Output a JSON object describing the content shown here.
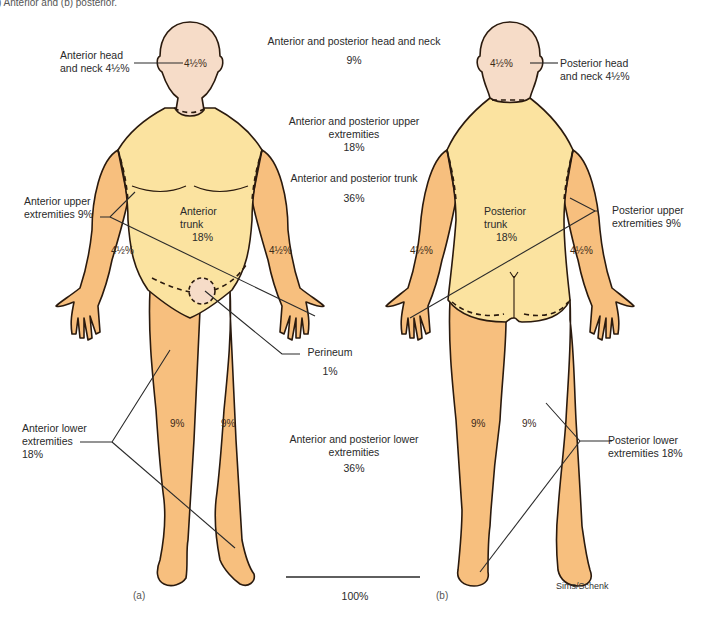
{
  "caption_fragment": ") Anterior and (b) posterior.",
  "colors": {
    "head": "#f6dcc8",
    "trunk": "#fbe3a0",
    "limbs": "#f7bf7e",
    "outline": "#2a1a0e",
    "text": "#2a2a2a"
  },
  "anterior": {
    "panel_label": "(a)",
    "head_neck": {
      "label_line1": "Anterior head",
      "label_line2": "and neck 4½%",
      "value": "4½%"
    },
    "trunk": {
      "line1": "Anterior",
      "line2": "trunk",
      "value": "18%"
    },
    "upper_extremities": {
      "label_line1": "Anterior upper",
      "label_line2": "extremities 9%",
      "left_arm": "4½%",
      "right_arm": "4½%"
    },
    "lower_extremities": {
      "label_line1": "Anterior lower",
      "label_line2": "extremities",
      "label_line3": "18%",
      "left_leg": "9%",
      "right_leg": "9%"
    },
    "perineum": {
      "label": "Perineum",
      "value": "1%"
    }
  },
  "posterior": {
    "panel_label": "(b)",
    "head_neck": {
      "label_line1": "Posterior head",
      "label_line2": "and neck 4½%",
      "value": "4½%"
    },
    "trunk": {
      "line1": "Posterior",
      "line2": "trunk",
      "value": "18%"
    },
    "upper_extremities": {
      "label_line1": "Posterior upper",
      "label_line2": "extremities 9%",
      "left_arm": "4½%",
      "right_arm": "4½%"
    },
    "lower_extremities": {
      "label_line1": "Posterior lower",
      "label_line2": "extremities 18%",
      "left_leg": "9%",
      "right_leg": "9%"
    },
    "credit": "Sims/Schenk"
  },
  "totals": {
    "head_neck": {
      "line1": "Anterior and posterior head and neck",
      "value": "9%"
    },
    "upper": {
      "line1": "Anterior and posterior upper",
      "line2": "extremities",
      "value": "18%"
    },
    "trunk": {
      "line1": "Anterior and posterior trunk",
      "value": "36%"
    },
    "lower": {
      "line1": "Anterior and posterior lower",
      "line2": "extremities",
      "value": "36%"
    },
    "grand_total": "100%"
  }
}
